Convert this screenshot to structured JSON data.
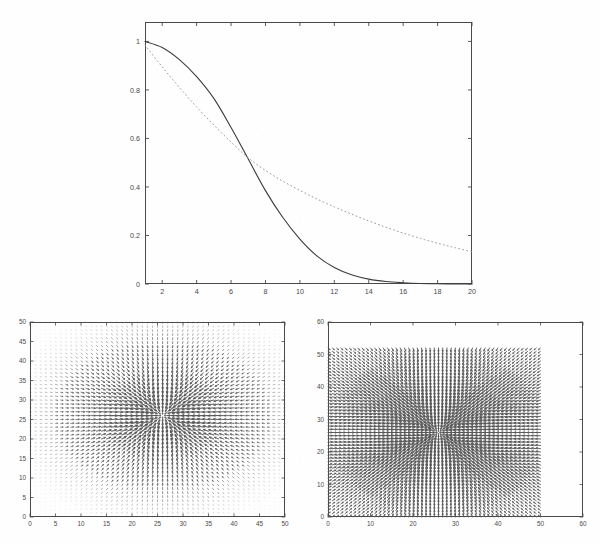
{
  "figure": {
    "kind": "matlab-multi-subplot-figure",
    "background": "#fefefe",
    "axis_color": "#4a4a4a",
    "panels": [
      "decay-curves",
      "quiver-left",
      "quiver-right"
    ]
  },
  "chart_data": [
    {
      "id": "decay-curves",
      "type": "line",
      "title": "",
      "xlabel": "",
      "ylabel": "",
      "xlim": [
        1,
        20
      ],
      "ylim": [
        0,
        1.08
      ],
      "grid": false,
      "legend": "none",
      "xticks": [
        2,
        4,
        6,
        8,
        10,
        12,
        14,
        16,
        18,
        20
      ],
      "xticklabels": [
        "2",
        "4",
        "6",
        "8",
        "10",
        "12",
        "14",
        "16",
        "18",
        "20"
      ],
      "yticks": [
        0,
        0.2,
        0.4,
        0.6,
        0.8,
        1
      ],
      "yticklabels": [
        "0",
        "0.2",
        "0.4",
        "0.6",
        "0.8",
        "1"
      ],
      "x": [
        1,
        2,
        3,
        4,
        5,
        6,
        7,
        8,
        9,
        10,
        11,
        12,
        13,
        14,
        15,
        16,
        17,
        18,
        19,
        20
      ],
      "series": [
        {
          "name": "solid-curve",
          "style": "solid",
          "color": "#3c3c3c",
          "width": 1.1,
          "values": [
            1.0,
            0.975,
            0.925,
            0.855,
            0.765,
            0.645,
            0.515,
            0.385,
            0.275,
            0.185,
            0.115,
            0.068,
            0.038,
            0.02,
            0.01,
            0.005,
            0.002,
            0.001,
            0.0005,
            0.0
          ]
        },
        {
          "name": "dotted-curve",
          "style": "dotted",
          "color": "#9a9a9a",
          "width": 1.0,
          "values": [
            0.985,
            0.895,
            0.81,
            0.73,
            0.655,
            0.585,
            0.52,
            0.468,
            0.424,
            0.386,
            0.35,
            0.318,
            0.288,
            0.26,
            0.234,
            0.21,
            0.188,
            0.168,
            0.15,
            0.133
          ]
        }
      ],
      "annotations": [
        "curves cross near x=6.3, y=0.57"
      ]
    },
    {
      "id": "quiver-left",
      "type": "quiver",
      "title": "",
      "xlabel": "",
      "ylabel": "",
      "xlim": [
        0,
        50
      ],
      "ylim": [
        0,
        50
      ],
      "grid": false,
      "xticks": [
        0,
        5,
        10,
        15,
        20,
        25,
        30,
        35,
        40,
        45,
        50
      ],
      "xticklabels": [
        "0",
        "5",
        "10",
        "15",
        "20",
        "25",
        "30",
        "35",
        "40",
        "45",
        "50"
      ],
      "yticks": [
        0,
        5,
        10,
        15,
        20,
        25,
        30,
        35,
        40,
        45,
        50
      ],
      "yticklabels": [
        "0",
        "5",
        "10",
        "15",
        "20",
        "25",
        "30",
        "35",
        "40",
        "45",
        "50"
      ],
      "field": "convergent-sink",
      "center": [
        26,
        26
      ],
      "grid_step": 1.0,
      "grid_nx": 50,
      "grid_ny": 50,
      "decay_radius": 14,
      "max_arrow_len": 1.4,
      "arrow_color": "#555555",
      "description": "Dense vector field converging on a single sink near (26,26); arrow magnitude decays radially so only a roughly circular blob of arrows is visible against a faint speckled background."
    },
    {
      "id": "quiver-right",
      "type": "quiver",
      "title": "",
      "xlabel": "",
      "ylabel": "",
      "xlim": [
        0,
        60
      ],
      "ylim": [
        0,
        60
      ],
      "grid": false,
      "xticks": [
        0,
        10,
        20,
        30,
        40,
        50,
        60
      ],
      "xticklabels": [
        "0",
        "10",
        "20",
        "30",
        "40",
        "50",
        "60"
      ],
      "yticks": [
        0,
        10,
        20,
        30,
        40,
        50,
        60
      ],
      "yticklabels": [
        "0",
        "10",
        "20",
        "30",
        "40",
        "50",
        "60"
      ],
      "field": "convergent-sink",
      "center": [
        26,
        26
      ],
      "grid_step": 1.0,
      "grid_nx": 50,
      "grid_ny": 52,
      "data_extent": [
        [
          0,
          50
        ],
        [
          0,
          52
        ]
      ],
      "decay_radius": 30,
      "max_arrow_len": 1.5,
      "arrow_color": "#555555",
      "description": "Dense uniform vector field over a 0-50 region converging sharply on a sink near (26,26); arrows remain faintly visible across the whole grid and darken strongly toward the centre."
    }
  ]
}
